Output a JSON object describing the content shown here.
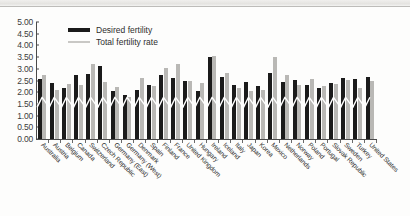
{
  "chart_data": {
    "type": "bar",
    "title": "",
    "subtitle": "",
    "xlabel": "",
    "ylabel": "",
    "ylim": [
      0.0,
      5.0
    ],
    "ytick_values": [
      5.0,
      4.5,
      4.0,
      3.5,
      3.0,
      2.5,
      2.0,
      1.5,
      1.0,
      0.5,
      0.0
    ],
    "ytick_labels": [
      "5.00",
      "4.50",
      "4.00",
      "3.50",
      "3.00",
      "2.50",
      "2.00",
      "1.50",
      "1.00",
      "0.50",
      "0.00"
    ],
    "grid": false,
    "legend_position": "top-left-inside",
    "overlay_line": {
      "name": "zigzag-connector",
      "color": "#ffffff",
      "description": "white connector line drawn across the bars"
    },
    "categories": [
      "Australia",
      "Austria",
      "Belgium",
      "Canada",
      "Switzerland",
      "Czech Republic",
      "Germany (East)",
      "Germany (West)",
      "Denmark",
      "Spain",
      "Finland",
      "France",
      "United Kingdom",
      "Hungary",
      "Ireland",
      "Iceland",
      "Italy",
      "Japan",
      "Korea",
      "Mexico",
      "Netherlands",
      "Norway",
      "Poland",
      "Portugal",
      "Slovak Republic",
      "Sweden",
      "Turkey",
      "United States"
    ],
    "series": [
      {
        "name": "Desired fertility",
        "color": "#1b1b1b",
        "values": [
          2.55,
          2.4,
          2.18,
          2.72,
          2.78,
          3.14,
          2.05,
          1.9,
          2.1,
          2.32,
          2.72,
          2.62,
          2.5,
          2.05,
          3.52,
          2.65,
          2.3,
          2.42,
          2.25,
          2.8,
          2.45,
          2.52,
          2.3,
          2.2,
          2.4,
          2.6,
          2.55,
          2.65
        ]
      },
      {
        "name": "Total fertility rate",
        "color": "#b9b8b5",
        "values": [
          2.75,
          2.1,
          2.35,
          2.3,
          3.2,
          2.45,
          2.22,
          1.8,
          2.6,
          2.28,
          3.05,
          3.2,
          2.5,
          2.4,
          3.55,
          2.8,
          2.18,
          2.05,
          2.1,
          3.5,
          2.72,
          2.3,
          2.58,
          2.25,
          2.35,
          2.52,
          2.2,
          2.48
        ]
      }
    ]
  },
  "legend": {
    "items": [
      {
        "label": "Desired fertility",
        "swatch": "solid-bar",
        "color": "#1b1b1b"
      },
      {
        "label": "Total fertility rate",
        "swatch": "thin-line",
        "color": "#c9c8c5"
      }
    ]
  }
}
